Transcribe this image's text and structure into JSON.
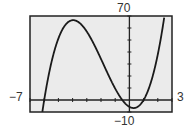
{
  "chart_data": {
    "type": "line",
    "title": "",
    "xlabel": "",
    "ylabel": "",
    "xlim": [
      -7,
      3
    ],
    "ylim": [
      -10,
      70
    ],
    "x_tick_step": 1,
    "y_tick_step": 10,
    "grid": false,
    "axis_labels": {
      "xmin": "−7",
      "xmax": "3",
      "ymin": "−10",
      "ymax": "70"
    },
    "series": [
      {
        "name": "f(x)",
        "description": "cubic curve with x-intercepts near −6, −0.5, 1; local max ≈ (−4, 66); local min ≈ (0.3, −7)",
        "x": [
          -6.3,
          -6,
          -5.5,
          -5,
          -4.5,
          -4,
          -3.5,
          -3,
          -2.5,
          -2,
          -1.5,
          -1,
          -0.5,
          0,
          0.3,
          0.5,
          1,
          1.5,
          2,
          2.5
        ],
        "y": [
          -10,
          0,
          26,
          51,
          62,
          66,
          64,
          57,
          47,
          34,
          21,
          9,
          0,
          -6,
          -7,
          -6,
          0,
          11,
          28,
          51
        ]
      }
    ]
  },
  "labels": {
    "ymax": "70",
    "ymin": "−10",
    "xmin": "−7",
    "xmax": "3"
  },
  "colors": {
    "background": "#ebebeb",
    "frame": "#222222",
    "curve": "#1a1a1a"
  }
}
